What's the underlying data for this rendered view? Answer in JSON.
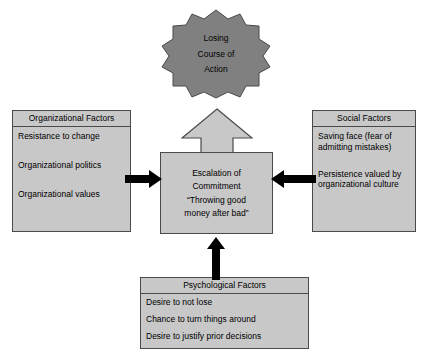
{
  "diagram": {
    "colors": {
      "box_fill": "#c8c8c8",
      "box_border": "#4a4a4a",
      "burst_fill": "#808080",
      "arrow_fill": "#000000",
      "block_arrow_fill": "#c8c8c8",
      "background": "#ffffff"
    }
  },
  "outcome": {
    "shape": "starburst",
    "lines": [
      "Losing",
      "Course of",
      "Action"
    ]
  },
  "center": {
    "lines": [
      "Escalation of",
      "Commitment",
      "“Throwing good",
      "money after bad”"
    ]
  },
  "organizational": {
    "header": "Organizational Factors",
    "items": [
      "Resistance to change",
      "Organizational politics",
      "Organizational values"
    ]
  },
  "social": {
    "header": "Social Factors",
    "items": [
      "Saving face (fear of admitting mistakes)",
      "Persistence valued by organizational culture"
    ]
  },
  "psychological": {
    "header": "Psychological Factors",
    "items": [
      "Desire to not lose",
      "Chance to turn things around",
      "Desire to justify prior decisions"
    ]
  },
  "arrows": {
    "left_to_center": "right-arrow-icon",
    "right_to_center": "left-arrow-icon",
    "bottom_to_center": "up-arrow-icon",
    "center_to_outcome": "block-up-arrow-icon"
  }
}
